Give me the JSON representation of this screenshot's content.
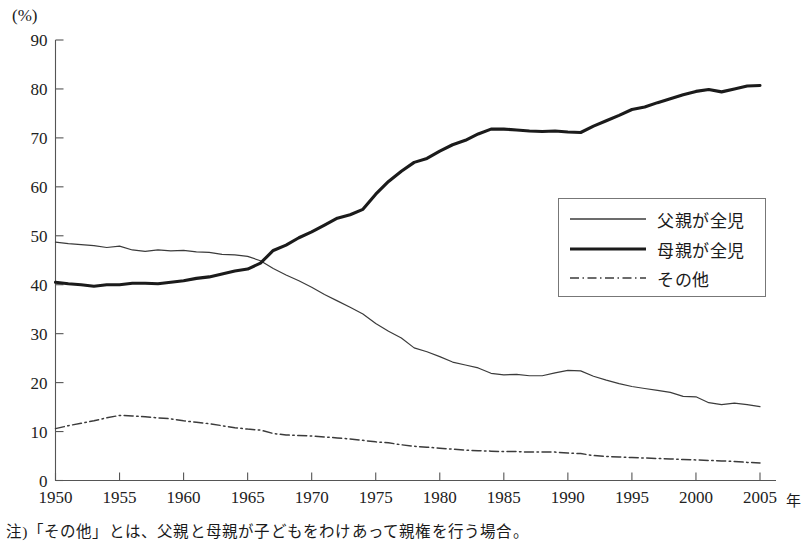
{
  "axis": {
    "unit_label": "(%)",
    "x_unit_suffix": "年",
    "y_ticks": [
      "0",
      "10",
      "20",
      "30",
      "40",
      "50",
      "60",
      "70",
      "80",
      "90"
    ],
    "x_ticks": [
      "1950",
      "1955",
      "1960",
      "1965",
      "1970",
      "1975",
      "1980",
      "1985",
      "1990",
      "1995",
      "2000",
      "2005"
    ]
  },
  "legend": {
    "items": [
      {
        "label": "父親が全児",
        "style": "thin-solid",
        "color": "#3b3b3b"
      },
      {
        "label": "母親が全児",
        "style": "thick-solid",
        "color": "#1b1b1b"
      },
      {
        "label": "その他",
        "style": "dash-dot",
        "color": "#3b3b3b"
      }
    ]
  },
  "footnote": {
    "text": "注)「その他」とは、父親と母親が子どもをわけあって親権を行う場合。"
  },
  "chart_data": {
    "type": "line",
    "title": "",
    "xlabel": "年",
    "ylabel": "(%)",
    "xlim": [
      1950,
      2005
    ],
    "ylim": [
      0,
      90
    ],
    "grid": false,
    "legend_position": "inside-right-upper",
    "x": [
      1950,
      1951,
      1952,
      1953,
      1954,
      1955,
      1956,
      1957,
      1958,
      1959,
      1960,
      1961,
      1962,
      1963,
      1964,
      1965,
      1966,
      1967,
      1968,
      1969,
      1970,
      1971,
      1972,
      1973,
      1974,
      1975,
      1976,
      1977,
      1978,
      1979,
      1980,
      1981,
      1982,
      1983,
      1984,
      1985,
      1986,
      1987,
      1988,
      1989,
      1990,
      1991,
      1992,
      1993,
      1994,
      1995,
      1996,
      1997,
      1998,
      1999,
      2000,
      2001,
      2002,
      2003,
      2004,
      2005
    ],
    "series": [
      {
        "name": "父親が全児",
        "values": [
          48.7,
          48.4,
          48.2,
          48.0,
          47.6,
          47.9,
          47.1,
          46.8,
          47.1,
          46.9,
          47.0,
          46.7,
          46.6,
          46.2,
          46.1,
          45.8,
          44.9,
          43.3,
          42.0,
          40.8,
          39.5,
          38.0,
          36.7,
          35.4,
          34.0,
          32.1,
          30.5,
          29.1,
          27.1,
          26.3,
          25.3,
          24.2,
          23.6,
          23.0,
          21.9,
          21.6,
          21.7,
          21.4,
          21.4,
          22.0,
          22.5,
          22.4,
          21.3,
          20.5,
          19.8,
          19.2,
          18.8,
          18.4,
          18.0,
          17.2,
          17.1,
          15.9,
          15.5,
          15.8,
          15.5,
          15.1
        ]
      },
      {
        "name": "母親が全児",
        "values": [
          40.5,
          40.2,
          40.0,
          39.7,
          40.0,
          40.0,
          40.3,
          40.3,
          40.2,
          40.5,
          40.8,
          41.3,
          41.6,
          42.2,
          42.8,
          43.2,
          44.4,
          47.0,
          48.1,
          49.6,
          50.8,
          52.2,
          53.6,
          54.3,
          55.4,
          58.5,
          61.1,
          63.2,
          65.0,
          65.8,
          67.3,
          68.6,
          69.5,
          70.8,
          71.8,
          71.8,
          71.6,
          71.4,
          71.3,
          71.4,
          71.2,
          71.1,
          72.4,
          73.5,
          74.6,
          75.8,
          76.3,
          77.2,
          78.0,
          78.8,
          79.5,
          79.9,
          79.4,
          80.0,
          80.6,
          80.7
        ]
      },
      {
        "name": "その他",
        "values": [
          10.6,
          11.2,
          11.7,
          12.2,
          12.8,
          13.3,
          13.2,
          13.0,
          12.8,
          12.6,
          12.2,
          11.9,
          11.6,
          11.2,
          10.8,
          10.5,
          10.3,
          9.6,
          9.3,
          9.2,
          9.1,
          8.9,
          8.7,
          8.5,
          8.2,
          7.9,
          7.7,
          7.3,
          7.0,
          6.8,
          6.6,
          6.4,
          6.2,
          6.1,
          6.0,
          5.9,
          5.9,
          5.8,
          5.8,
          5.8,
          5.6,
          5.5,
          5.1,
          4.9,
          4.8,
          4.7,
          4.6,
          4.5,
          4.4,
          4.3,
          4.2,
          4.1,
          4.0,
          3.9,
          3.7,
          3.6
        ]
      }
    ]
  }
}
